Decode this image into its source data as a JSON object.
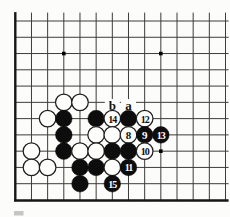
{
  "diagram": {
    "kind": "go-board-fragment",
    "grid": {
      "cols": 14,
      "rows": 12,
      "x0": 15.3,
      "y0": 21.0,
      "cell_x": 16.17,
      "cell_y": 16.27,
      "top_overhang_y": 12.6,
      "right_overhang_x": 228.6,
      "line_color": "#3c3c3c",
      "border_color": "#161616",
      "thin_width": 1,
      "border_width": 2.4,
      "left_edge_is_border": true,
      "bottom_edge_is_border": true,
      "top_edge_cut": true,
      "right_edge_cut": true
    },
    "star_points": [
      {
        "col": 4,
        "row": 3
      },
      {
        "col": 10,
        "row": 3
      },
      {
        "col": 10,
        "row": 9
      }
    ],
    "star_size": 3.6,
    "stones": [
      {
        "col": 4,
        "row": 6,
        "color": "white",
        "label": ""
      },
      {
        "col": 5,
        "row": 6,
        "color": "white",
        "label": ""
      },
      {
        "col": 3,
        "row": 7,
        "color": "white",
        "label": ""
      },
      {
        "col": 4,
        "row": 7,
        "color": "black",
        "label": ""
      },
      {
        "col": 6,
        "row": 7,
        "color": "black",
        "label": ""
      },
      {
        "col": 7,
        "row": 7,
        "color": "white",
        "label": "14"
      },
      {
        "col": 8,
        "row": 7,
        "color": "black",
        "label": ""
      },
      {
        "col": 9,
        "row": 7,
        "color": "white",
        "label": "12"
      },
      {
        "col": 4,
        "row": 8,
        "color": "black",
        "label": ""
      },
      {
        "col": 6,
        "row": 8,
        "color": "white",
        "label": ""
      },
      {
        "col": 7,
        "row": 8,
        "color": "white",
        "label": ""
      },
      {
        "col": 8,
        "row": 8,
        "color": "white",
        "label": "8"
      },
      {
        "col": 9,
        "row": 8,
        "color": "black",
        "label": "9"
      },
      {
        "col": 10,
        "row": 8,
        "color": "black",
        "label": "13"
      },
      {
        "col": 2,
        "row": 9,
        "color": "white",
        "label": ""
      },
      {
        "col": 4,
        "row": 9,
        "color": "black",
        "label": ""
      },
      {
        "col": 5,
        "row": 9,
        "color": "white",
        "label": ""
      },
      {
        "col": 6,
        "row": 9,
        "color": "white",
        "label": ""
      },
      {
        "col": 7,
        "row": 9,
        "color": "black",
        "label": ""
      },
      {
        "col": 8,
        "row": 9,
        "color": "black",
        "label": ""
      },
      {
        "col": 9,
        "row": 9,
        "color": "white",
        "label": "10"
      },
      {
        "col": 2,
        "row": 10,
        "color": "white",
        "label": ""
      },
      {
        "col": 3,
        "row": 10,
        "color": "white",
        "label": ""
      },
      {
        "col": 5,
        "row": 10,
        "color": "black",
        "label": ""
      },
      {
        "col": 6,
        "row": 10,
        "color": "black",
        "label": ""
      },
      {
        "col": 7,
        "row": 10,
        "color": "white",
        "label": ""
      },
      {
        "col": 8,
        "row": 10,
        "color": "black",
        "label": "11"
      },
      {
        "col": 5,
        "row": 11,
        "color": "black",
        "label": ""
      },
      {
        "col": 7,
        "row": 11,
        "color": "black",
        "label": "15"
      }
    ],
    "stone_style": {
      "radius": 8.3,
      "black_fill": "#0d0d0d",
      "white_fill": "#fdfdfc",
      "white_stroke": "#1e1e1e",
      "white_stroke_width": 1.25,
      "number_font_size_single": 11,
      "number_font_size_double": 10,
      "number_color_on_black": "#ffffff",
      "number_color_on_white": "#0d0d0d"
    },
    "point_labels": [
      {
        "col": 7,
        "row": 6,
        "text": "b"
      },
      {
        "col": 8,
        "row": 6,
        "text": "a"
      }
    ],
    "point_label_style": {
      "dy": 3.2,
      "font_size": 13,
      "color": "#141414",
      "patch_color": "#fcfcfa",
      "patch_w": 15,
      "patch_h": 13
    },
    "scan_artifact": {
      "x": 14,
      "y": 211,
      "w": 9.5,
      "h": 4.5,
      "color": "#c6c6c6"
    }
  }
}
